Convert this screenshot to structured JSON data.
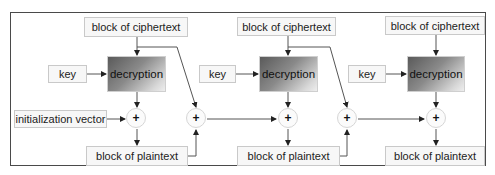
{
  "diagram": {
    "stages": [
      {
        "ciphertext_label": "block of ciphertext",
        "key_label": "key",
        "decryption_label": "decryption",
        "plaintext_label": "block of plaintext"
      },
      {
        "ciphertext_label": "block of ciphertext",
        "key_label": "key",
        "decryption_label": "decryption",
        "plaintext_label": "block of plaintext"
      },
      {
        "ciphertext_label": "block of ciphertext",
        "key_label": "key",
        "decryption_label": "decryption",
        "plaintext_label": "block of plaintext"
      }
    ],
    "iv_label": "initialization vector",
    "xor_symbol": "+",
    "colors": {
      "frame": "#4a4a4a",
      "box_fill": "#f7f7f7",
      "box_border": "#c9c9c9",
      "wire": "#555555",
      "decryption_gradient_dark": "#5a5a5a",
      "decryption_gradient_light": "#eeeeee"
    }
  }
}
